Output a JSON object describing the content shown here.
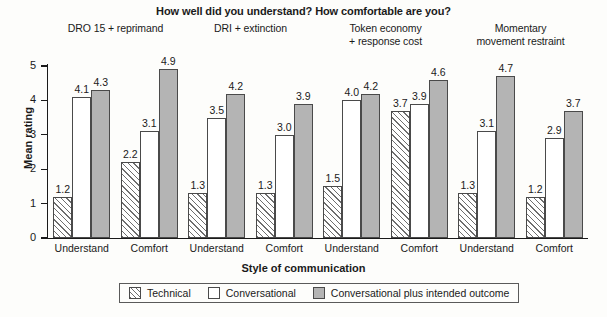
{
  "chart_data": {
    "type": "bar",
    "title": "How well did you understand? How comfortable are you?",
    "xlabel": "Style of communication",
    "ylabel": "Mean rating",
    "ylim": [
      0,
      5
    ],
    "yticks": [
      "0",
      "1",
      "2",
      "3",
      "4",
      "5"
    ],
    "grid": false,
    "legend_position": "bottom",
    "categories": [
      "Understand",
      "Comfort",
      "Understand",
      "Comfort",
      "Understand",
      "Comfort",
      "Understand",
      "Comfort"
    ],
    "panel_headers": [
      {
        "line1": "DRO 15 + reprimand",
        "line2": ""
      },
      {
        "line1": "DRI + extinction",
        "line2": ""
      },
      {
        "line1": "Token economy",
        "line2": "+ response cost"
      },
      {
        "line1": "Momentary",
        "line2": "movement restraint"
      }
    ],
    "series": [
      {
        "name": "Technical",
        "color": "#ffffff",
        "pattern": "diagonal-hatch",
        "values": [
          1.2,
          2.2,
          1.3,
          1.3,
          1.5,
          3.7,
          1.3,
          1.2
        ]
      },
      {
        "name": "Conversational",
        "color": "#ffffff",
        "pattern": "solid",
        "values": [
          4.1,
          3.1,
          3.5,
          3.0,
          4.0,
          3.9,
          3.1,
          2.9
        ]
      },
      {
        "name": "Conversational plus intended outcome",
        "color": "#b4b4b4",
        "pattern": "solid",
        "values": [
          4.3,
          4.9,
          4.2,
          3.9,
          4.2,
          4.6,
          4.7,
          3.7
        ]
      }
    ],
    "value_labels": [
      [
        "1.2",
        "2.2",
        "1.3",
        "1.3",
        "1.5",
        "3.7",
        "1.3",
        "1.2"
      ],
      [
        "4.1",
        "3.1",
        "3.5",
        "3.0",
        "4.0",
        "3.9",
        "3.1",
        "2.9"
      ],
      [
        "4.3",
        "4.9",
        "4.2",
        "3.9",
        "4.2",
        "4.6",
        "4.7",
        "3.7"
      ]
    ]
  },
  "legend": {
    "items": [
      {
        "label": "Technical",
        "style": "technical"
      },
      {
        "label": "Conversational",
        "style": "conversational"
      },
      {
        "label": "Conversational plus intended outcome",
        "style": "outcome"
      }
    ]
  }
}
